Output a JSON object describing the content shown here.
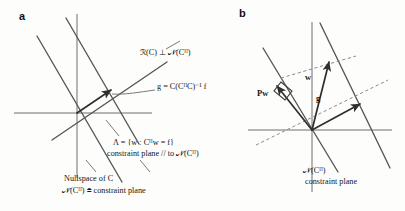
{
  "figure": {
    "panels": [
      {
        "letter": "a",
        "labels": {
          "range_perp_null": "ℛ(C) ⊥ 𝒩(Cᴴ)",
          "g_equation": "g = C(CᴴC)⁻¹ f",
          "lambda_set": "Λ = {w : Cᴴw = f}",
          "constraint_parallel": "constraint plane // to 𝒩(Cᴴ)",
          "nullspace_of_c": "Nullspace of C",
          "null_ch_definition": "𝒩(Cᴴ) ≜ constraint plane"
        }
      },
      {
        "letter": "b",
        "labels": {
          "projection_vector": "Pw",
          "w_vector": "w",
          "g_vector": "g",
          "null_ch": "𝒩(Cᴴ)",
          "constraint_plane": "constraint plane"
        }
      }
    ],
    "colors": {
      "background": "#fdfdfc",
      "ink": "#151515",
      "axis": "#6f6f6f",
      "plane_line": "#555555",
      "dashed_line": "#8a8a8a",
      "vector": "#2f2f2f"
    }
  }
}
